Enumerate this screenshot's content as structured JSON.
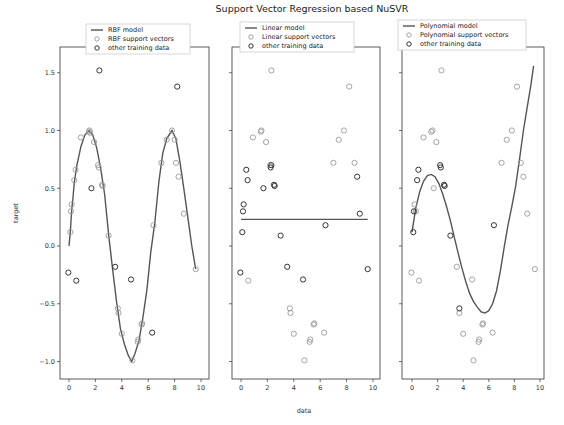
{
  "chart_data": {
    "type": "scatter",
    "title": "Support Vector Regression based NuSVR",
    "xlabel": "data",
    "ylabel": "target",
    "xlim": [
      -0.5,
      10.3
    ],
    "ylim": [
      -1.15,
      1.67
    ],
    "xticks": [
      0,
      2,
      4,
      6,
      8,
      10
    ],
    "yticks": [
      -1.0,
      -0.5,
      0.0,
      0.5,
      1.0,
      1.5
    ],
    "ytick_labels": [
      "−1.0",
      "−0.5",
      "0.0",
      "0.5",
      "1.0",
      "1.5"
    ],
    "grid": false,
    "legend_position": "above each subplot",
    "panels": [
      {
        "name": "rbf",
        "legend": [
          "RBF model",
          "RBF support vectors",
          "other training data"
        ],
        "model_curve": [
          [
            0.0,
            0.0
          ],
          [
            0.1,
            0.12
          ],
          [
            0.2,
            0.3
          ],
          [
            0.3,
            0.42
          ],
          [
            0.4,
            0.55
          ],
          [
            0.6,
            0.7
          ],
          [
            0.9,
            0.86
          ],
          [
            1.2,
            0.96
          ],
          [
            1.5,
            1.0
          ],
          [
            1.8,
            0.96
          ],
          [
            2.1,
            0.85
          ],
          [
            2.4,
            0.67
          ],
          [
            2.7,
            0.45
          ],
          [
            3.0,
            0.1
          ],
          [
            3.3,
            -0.2
          ],
          [
            3.6,
            -0.48
          ],
          [
            3.9,
            -0.72
          ],
          [
            4.2,
            -0.85
          ],
          [
            4.5,
            -0.95
          ],
          [
            4.75,
            -1.0
          ],
          [
            5.0,
            -0.93
          ],
          [
            5.3,
            -0.82
          ],
          [
            5.6,
            -0.62
          ],
          [
            5.9,
            -0.38
          ],
          [
            6.2,
            -0.05
          ],
          [
            6.5,
            0.2
          ],
          [
            6.8,
            0.55
          ],
          [
            7.1,
            0.8
          ],
          [
            7.4,
            0.93
          ],
          [
            7.8,
            1.0
          ],
          [
            8.1,
            0.93
          ],
          [
            8.4,
            0.73
          ],
          [
            8.7,
            0.5
          ],
          [
            9.0,
            0.25
          ],
          [
            9.3,
            0.0
          ],
          [
            9.6,
            -0.2
          ]
        ],
        "support_vectors": [
          [
            0.1,
            0.12
          ],
          [
            0.15,
            0.3
          ],
          [
            0.2,
            0.36
          ],
          [
            0.4,
            0.57
          ],
          [
            0.5,
            0.66
          ],
          [
            0.9,
            0.94
          ],
          [
            1.5,
            0.99
          ],
          [
            1.55,
            1.0
          ],
          [
            1.6,
            0.98
          ],
          [
            1.9,
            0.9
          ],
          [
            2.2,
            0.7
          ],
          [
            2.25,
            0.68
          ],
          [
            2.5,
            0.53
          ],
          [
            2.55,
            0.52
          ],
          [
            3.0,
            0.09
          ],
          [
            3.7,
            -0.54
          ],
          [
            3.75,
            -0.58
          ],
          [
            4.0,
            -0.76
          ],
          [
            4.8,
            -0.99
          ],
          [
            5.2,
            -0.83
          ],
          [
            5.25,
            -0.81
          ],
          [
            5.5,
            -0.68
          ],
          [
            5.55,
            -0.67
          ],
          [
            6.4,
            0.18
          ],
          [
            7.0,
            0.72
          ],
          [
            7.4,
            0.92
          ],
          [
            7.8,
            1.0
          ],
          [
            8.0,
            0.92
          ],
          [
            8.1,
            0.72
          ],
          [
            8.3,
            0.6
          ],
          [
            8.7,
            0.28
          ],
          [
            9.6,
            -0.2
          ]
        ],
        "other_data": [
          [
            -0.05,
            -0.23
          ],
          [
            0.55,
            -0.3
          ],
          [
            1.7,
            0.5
          ],
          [
            2.3,
            1.52
          ],
          [
            3.5,
            -0.18
          ],
          [
            4.7,
            -0.29
          ],
          [
            6.3,
            -0.75
          ],
          [
            8.2,
            1.38
          ]
        ]
      },
      {
        "name": "linear",
        "legend": [
          "Linear model",
          "Linear support vectors",
          "other training data"
        ],
        "model_curve": [
          [
            0.0,
            0.23
          ],
          [
            9.6,
            0.23
          ]
        ],
        "support_vectors": [
          [
            0.55,
            -0.3
          ],
          [
            1.5,
            0.99
          ],
          [
            1.55,
            1.0
          ],
          [
            0.9,
            0.94
          ],
          [
            1.9,
            0.9
          ],
          [
            2.3,
            1.52
          ],
          [
            2.2,
            0.7
          ],
          [
            3.7,
            -0.54
          ],
          [
            3.75,
            -0.58
          ],
          [
            4.0,
            -0.76
          ],
          [
            4.8,
            -0.99
          ],
          [
            5.2,
            -0.83
          ],
          [
            5.25,
            -0.81
          ],
          [
            5.5,
            -0.68
          ],
          [
            5.55,
            -0.67
          ],
          [
            6.3,
            -0.75
          ],
          [
            7.0,
            0.72
          ],
          [
            7.4,
            0.92
          ],
          [
            7.8,
            1.0
          ],
          [
            8.2,
            1.38
          ],
          [
            8.6,
            0.72
          ]
        ],
        "other_data": [
          [
            0.1,
            0.12
          ],
          [
            0.15,
            0.3
          ],
          [
            0.2,
            0.36
          ],
          [
            0.5,
            0.57
          ],
          [
            0.4,
            0.66
          ],
          [
            1.7,
            0.5
          ],
          [
            2.25,
            0.68
          ],
          [
            2.3,
            0.7
          ],
          [
            2.5,
            0.53
          ],
          [
            2.55,
            0.52
          ],
          [
            3.0,
            0.09
          ],
          [
            3.5,
            -0.18
          ],
          [
            4.7,
            -0.29
          ],
          [
            6.4,
            0.18
          ],
          [
            8.8,
            0.6
          ],
          [
            9.0,
            0.28
          ],
          [
            9.6,
            -0.2
          ],
          [
            -0.05,
            -0.23
          ]
        ]
      },
      {
        "name": "polynomial",
        "legend": [
          "Polynomial model",
          "Polynomial support vectors",
          "other training data"
        ],
        "model_curve": [
          [
            0.0,
            0.12
          ],
          [
            0.3,
            0.33
          ],
          [
            0.6,
            0.47
          ],
          [
            0.9,
            0.56
          ],
          [
            1.2,
            0.61
          ],
          [
            1.5,
            0.62
          ],
          [
            1.8,
            0.6
          ],
          [
            2.1,
            0.54
          ],
          [
            2.4,
            0.45
          ],
          [
            2.7,
            0.34
          ],
          [
            3.0,
            0.22
          ],
          [
            3.3,
            0.08
          ],
          [
            3.6,
            -0.06
          ],
          [
            3.9,
            -0.19
          ],
          [
            4.2,
            -0.31
          ],
          [
            4.5,
            -0.41
          ],
          [
            4.8,
            -0.48
          ],
          [
            5.1,
            -0.53
          ],
          [
            5.4,
            -0.57
          ],
          [
            5.7,
            -0.58
          ],
          [
            6.0,
            -0.56
          ],
          [
            6.3,
            -0.5
          ],
          [
            6.6,
            -0.39
          ],
          [
            6.9,
            -0.22
          ],
          [
            7.2,
            -0.01
          ],
          [
            7.5,
            0.18
          ],
          [
            7.8,
            0.34
          ],
          [
            8.1,
            0.52
          ],
          [
            8.4,
            0.75
          ],
          [
            8.7,
            1.0
          ],
          [
            9.0,
            1.2
          ],
          [
            9.3,
            1.4
          ],
          [
            9.5,
            1.56
          ]
        ],
        "support_vectors": [
          [
            -0.05,
            -0.23
          ],
          [
            0.55,
            -0.3
          ],
          [
            0.2,
            0.36
          ],
          [
            0.3,
            0.3
          ],
          [
            0.9,
            0.94
          ],
          [
            1.5,
            0.99
          ],
          [
            1.6,
            1.0
          ],
          [
            1.9,
            0.9
          ],
          [
            1.7,
            0.5
          ],
          [
            2.3,
            1.52
          ],
          [
            3.5,
            -0.18
          ],
          [
            3.7,
            -0.58
          ],
          [
            4.0,
            -0.76
          ],
          [
            4.7,
            -0.29
          ],
          [
            4.8,
            -0.99
          ],
          [
            5.2,
            -0.83
          ],
          [
            5.25,
            -0.81
          ],
          [
            5.5,
            -0.68
          ],
          [
            5.55,
            -0.67
          ],
          [
            6.3,
            -0.75
          ],
          [
            7.0,
            0.72
          ],
          [
            7.4,
            0.92
          ],
          [
            7.8,
            1.0
          ],
          [
            8.2,
            1.38
          ],
          [
            8.5,
            0.72
          ],
          [
            8.7,
            0.6
          ],
          [
            9.0,
            0.28
          ],
          [
            9.6,
            -0.2
          ]
        ],
        "other_data": [
          [
            0.1,
            0.12
          ],
          [
            0.15,
            0.3
          ],
          [
            0.4,
            0.57
          ],
          [
            0.5,
            0.66
          ],
          [
            2.2,
            0.7
          ],
          [
            2.25,
            0.68
          ],
          [
            2.5,
            0.53
          ],
          [
            2.55,
            0.52
          ],
          [
            3.0,
            0.09
          ],
          [
            3.7,
            -0.54
          ],
          [
            6.4,
            0.18
          ]
        ]
      }
    ]
  },
  "layout": {
    "panels_px": [
      {
        "x0": 60,
        "x1": 209,
        "y0": 47,
        "y1": 379,
        "x_zero_px": 69,
        "x_unit_px": 13.2,
        "legend_x": 86,
        "legend_y": 24
      },
      {
        "x0": 232,
        "x1": 380,
        "y0": 47,
        "y1": 379,
        "x_zero_px": 241,
        "x_unit_px": 13.2,
        "legend_x": 240,
        "legend_y": 22
      },
      {
        "x0": 402,
        "x1": 544,
        "y0": 47,
        "y1": 379,
        "x_zero_px": 412,
        "x_unit_px": 12.8,
        "legend_x": 398,
        "legend_y": 20
      }
    ],
    "y_zero_px": 246,
    "y_unit_px": 115.5,
    "colors": {
      "axes": "#333333",
      "model_line": "#555555",
      "support_vectors": "#9a9a9a",
      "other_data": "#333333",
      "legend_border": "#cccccc"
    }
  }
}
